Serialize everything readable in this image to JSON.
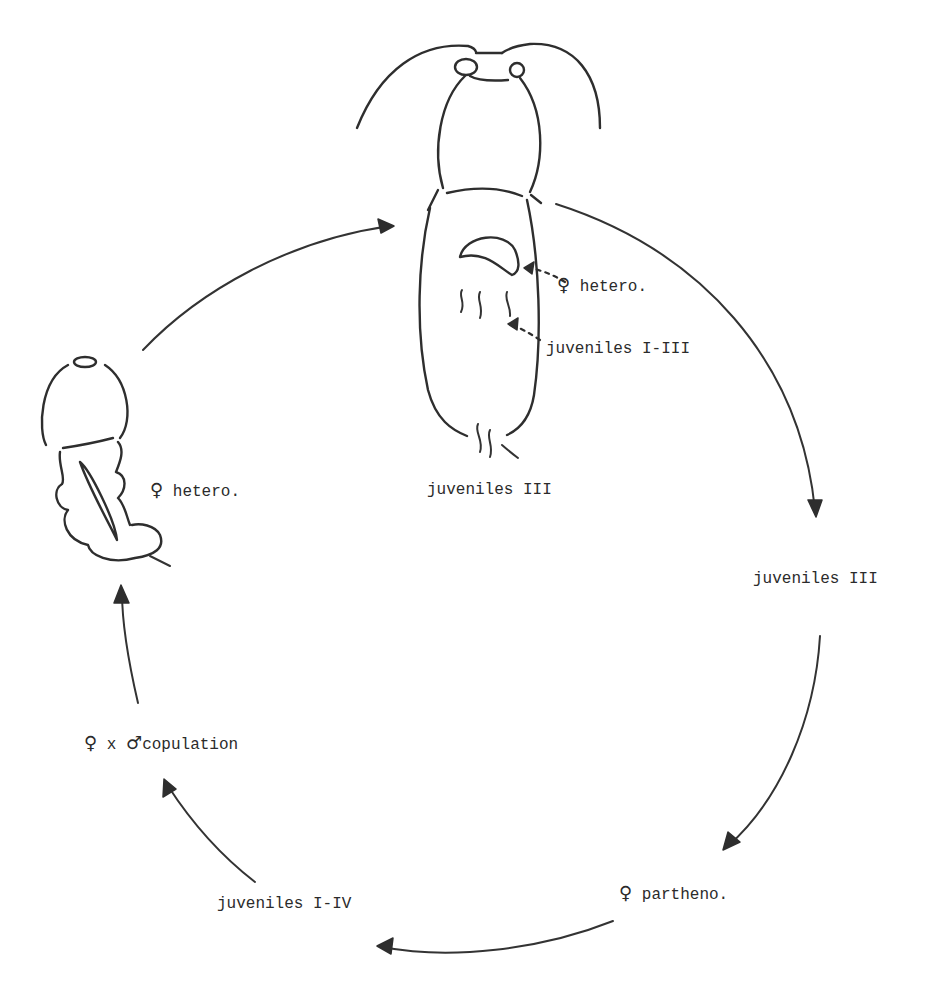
{
  "diagram": {
    "type": "life-cycle",
    "nodes": [
      {
        "id": "top_organism",
        "caption": "juveniles III",
        "inner_labels": [
          {
            "symbol": "♀",
            "text": "hetero."
          },
          {
            "text": "juveniles I-III"
          }
        ]
      },
      {
        "id": "right_upper",
        "text": "juveniles III"
      },
      {
        "id": "bottom_right",
        "symbol": "♀",
        "text": "partheno."
      },
      {
        "id": "bottom_left",
        "text": "juveniles I-IV"
      },
      {
        "id": "left_copulation",
        "symbol_female": "♀",
        "connector": "x",
        "symbol_male": "♂",
        "text": "copulation"
      },
      {
        "id": "left_organism",
        "symbol": "♀",
        "text": "hetero."
      }
    ],
    "edges": [
      {
        "from": "top_organism",
        "to": "right_upper",
        "style": "solid-arrow"
      },
      {
        "from": "right_upper",
        "to": "bottom_right",
        "style": "solid-arrow"
      },
      {
        "from": "bottom_right",
        "to": "bottom_left",
        "style": "solid-arrow"
      },
      {
        "from": "bottom_left",
        "to": "left_copulation",
        "style": "solid-arrow"
      },
      {
        "from": "left_copulation",
        "to": "left_organism",
        "style": "solid-arrow"
      },
      {
        "from": "left_organism",
        "to": "top_organism",
        "style": "solid-arrow"
      },
      {
        "from": "inner_hetero_label",
        "to": "top_organism_sac",
        "style": "dashed-arrow"
      },
      {
        "from": "inner_juveniles_label",
        "to": "top_organism_juveniles",
        "style": "dashed-arrow"
      }
    ]
  },
  "labels": {
    "top_hetero_symbol": "♀",
    "top_hetero_text": "hetero.",
    "top_juveniles_inner": "juveniles I-III",
    "top_caption": "juveniles III",
    "right_juveniles": "juveniles III",
    "partheno_symbol": "♀",
    "partheno_text": "partheno.",
    "bottom_juveniles": "juveniles I-IV",
    "copulation_female": "♀",
    "copulation_x": "x",
    "copulation_male": "♂",
    "copulation_text": "copulation",
    "left_hetero_symbol": "♀",
    "left_hetero_text": "hetero."
  },
  "colors": {
    "ink": "#2e2e2e",
    "background": "#ffffff"
  }
}
